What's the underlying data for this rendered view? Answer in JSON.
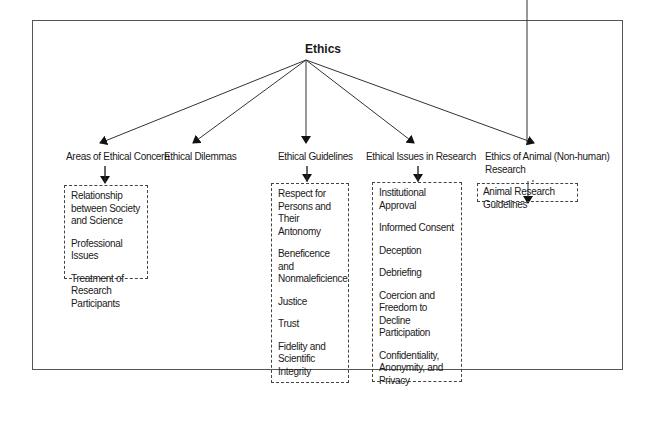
{
  "root": {
    "label": "Ethics"
  },
  "categories": [
    {
      "label": "Areas of Ethical Concern"
    },
    {
      "label": "Ethical Dilemmas"
    },
    {
      "label": "Ethical Guidelines"
    },
    {
      "label": "Ethical Issues in Research"
    },
    {
      "label": "Ethics of  Animal (Non-human) Research"
    }
  ],
  "boxes": {
    "areas": [
      "Relationship between Society and Science",
      "Professional Issues",
      "Treatment of Research Participants"
    ],
    "guidelines": [
      "Respect for Persons and Their Antonomy",
      "Beneficence and Nonmaleficience",
      "Justice",
      "Trust",
      "Fidelity and Scientific Integrity"
    ],
    "issues": [
      "Institutional Approval",
      "Informed Consent",
      "Deception",
      "Debriefing",
      "Coercion and Freedom to Decline Participation",
      "Confidentiality, Anonymity, and Privacy"
    ],
    "animal": [
      "Animal Research Guidelines"
    ]
  }
}
